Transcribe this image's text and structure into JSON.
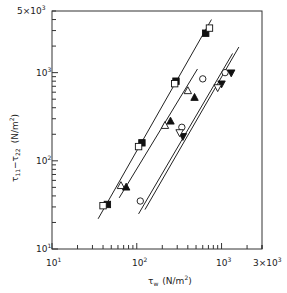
{
  "chart_data": {
    "type": "scatter",
    "title": "",
    "xlabel": "τ_w (N/m²)",
    "ylabel": "τ11 − τ22 (N/m²)",
    "xscale": "log",
    "yscale": "log",
    "xlim": [
      10,
      3000
    ],
    "ylim": [
      10,
      5000
    ],
    "grid": false,
    "legend": "none",
    "x_tick_labels": [
      "10¹",
      "10²",
      "10³",
      "3×10³"
    ],
    "y_tick_labels": [
      "10¹",
      "10²",
      "10³",
      "5×10³"
    ],
    "series": [
      {
        "name": "filled-square",
        "marker": "square-filled",
        "points": [
          [
            45,
            32
          ],
          [
            115,
            160
          ],
          [
            290,
            800
          ],
          [
            650,
            2800
          ]
        ]
      },
      {
        "name": "open-square",
        "marker": "square-open",
        "points": [
          [
            40,
            31
          ],
          [
            105,
            145
          ],
          [
            280,
            750
          ],
          [
            720,
            3200
          ]
        ]
      },
      {
        "name": "open-triangle",
        "marker": "triangle-open",
        "points": [
          [
            65,
            52
          ],
          [
            215,
            250
          ],
          [
            400,
            620
          ]
        ]
      },
      {
        "name": "filled-triangle",
        "marker": "triangle-filled",
        "points": [
          [
            75,
            50
          ],
          [
            250,
            280
          ],
          [
            480,
            520
          ]
        ]
      },
      {
        "name": "open-circle",
        "marker": "circle-open",
        "points": [
          [
            110,
            35
          ],
          [
            340,
            240
          ],
          [
            600,
            850
          ],
          [
            1100,
            1000
          ]
        ]
      },
      {
        "name": "filled-inverted-triangle",
        "marker": "triangle-down-filled",
        "points": [
          [
            350,
            190
          ],
          [
            1000,
            750
          ],
          [
            1300,
            1000
          ]
        ]
      },
      {
        "name": "open-inverted-triangle",
        "marker": "triangle-down-open",
        "points": [
          [
            320,
            210
          ],
          [
            900,
            680
          ]
        ]
      }
    ],
    "fit_lines": [
      {
        "from": [
          35,
          22
        ],
        "to": [
          760,
          4000
        ]
      },
      {
        "from": [
          62,
          38
        ],
        "to": [
          520,
          1100
        ]
      },
      {
        "from": [
          105,
          25
        ],
        "to": [
          1350,
          1650
        ]
      },
      {
        "from": [
          125,
          28
        ],
        "to": [
          1600,
          1950
        ]
      }
    ]
  },
  "axes": {
    "x_label_sym": "τ",
    "x_label_sub": "w",
    "x_label_unit": "(N/m",
    "x_label_sup": "2",
    "x_label_close": ")",
    "y_label_sym": "τ",
    "y_label_sub1": "11",
    "y_label_mid": "−τ",
    "y_label_sub2": "22",
    "y_label_unit": "(N/m",
    "y_label_sup": "2",
    "y_label_close": ")",
    "xtick_10_base": "10",
    "xtick_10_exp": "1",
    "xtick_100_base": "10",
    "xtick_100_exp": "2",
    "xtick_1000_base": "10",
    "xtick_1000_exp": "3",
    "xtick_3000_base": "3×10",
    "xtick_3000_exp": "3",
    "ytick_10_base": "10",
    "ytick_10_exp": "1",
    "ytick_100_base": "10",
    "ytick_100_exp": "2",
    "ytick_1000_base": "10",
    "ytick_1000_exp": "3",
    "ytick_5000_base": "5×10",
    "ytick_5000_exp": "3"
  }
}
